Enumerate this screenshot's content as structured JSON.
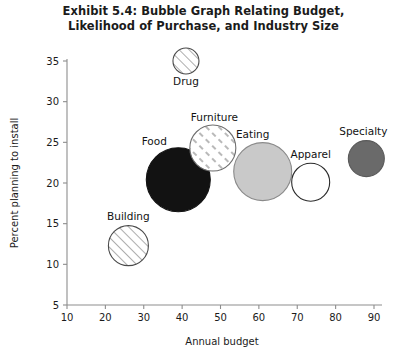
{
  "chart_data": {
    "type": "scatter",
    "title": "Exhibit 5.4: Bubble Graph Relating Budget, Likelihood of Purchase, and Industry Size",
    "title_line1": "Exhibit 5.4: Bubble Graph Relating Budget,",
    "title_line2": "Likelihood of Purchase, and Industry Size",
    "xlabel": "Annual budget",
    "ylabel": "Percent planning to install",
    "xlim": [
      10,
      90
    ],
    "ylim": [
      5,
      35
    ],
    "xticks": [
      10,
      20,
      30,
      40,
      50,
      60,
      70,
      80,
      90
    ],
    "yticks": [
      5,
      10,
      15,
      20,
      25,
      30,
      35
    ],
    "grid": false,
    "legend": "none",
    "size_meaning": "Industry size (bubble area)",
    "points": [
      {
        "label": "Drug",
        "x": 41,
        "y": 35,
        "radius_px": 13,
        "fill": "diagonal-hatch",
        "fill_color": "#ffffff",
        "stroke": "#4a4a4a",
        "label_dx": 0,
        "label_dy": 24,
        "label_anchor": "middle"
      },
      {
        "label": "Furniture",
        "x": 48,
        "y": 24.3,
        "radius_px": 23,
        "fill": "dash-hatch",
        "fill_color": "#ffffff",
        "stroke": "#6e6e6e",
        "label_dx": -22,
        "label_dy": -27,
        "label_anchor": "start"
      },
      {
        "label": "Food",
        "x": 39,
        "y": 20.4,
        "radius_px": 32,
        "fill": "solid",
        "fill_color": "#121212",
        "stroke": "#121212",
        "label_dx": -24,
        "label_dy": -35,
        "label_anchor": "middle"
      },
      {
        "label": "Eating",
        "x": 61,
        "y": 21.4,
        "radius_px": 29,
        "fill": "solid",
        "fill_color": "#c9c9c9",
        "stroke": "#8a8a8a",
        "label_dx": -10,
        "label_dy": -34,
        "label_anchor": "middle"
      },
      {
        "label": "Apparel",
        "x": 73.5,
        "y": 20.1,
        "radius_px": 19,
        "fill": "solid",
        "fill_color": "#ffffff",
        "stroke": "#2b2b2b",
        "label_dx": 0,
        "label_dy": -24,
        "label_anchor": "middle"
      },
      {
        "label": "Specialty",
        "x": 88,
        "y": 23,
        "radius_px": 18,
        "fill": "solid",
        "fill_color": "#6a6a6a",
        "stroke": "#5a5a5a",
        "label_dx": -3,
        "label_dy": -24,
        "label_anchor": "middle"
      },
      {
        "label": "Building",
        "x": 26,
        "y": 12.3,
        "radius_px": 20,
        "fill": "diagonal-hatch",
        "fill_color": "#ffffff",
        "stroke": "#4a4a4a",
        "label_dx": 0,
        "label_dy": -26,
        "label_anchor": "middle"
      }
    ]
  },
  "figure": {
    "background": "#ffffff",
    "axis_color": "#8d8d8d",
    "text_color": "#1b1b1b"
  }
}
